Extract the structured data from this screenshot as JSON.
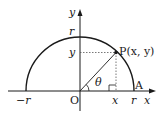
{
  "diagram": {
    "type": "unit-circle-semicircle",
    "colors": {
      "stroke": "#1a1a1a",
      "dashed": "#555555",
      "background": "#ffffff"
    },
    "axes": {
      "x_label": "x",
      "y_label": "y"
    },
    "labels": {
      "origin": "O",
      "point": "P(x, y)",
      "point_A": "A",
      "angle": "θ",
      "y_tick_r": "r",
      "y_tick_y": "y",
      "x_tick_neg_r": "−r",
      "x_tick_x": "x",
      "x_tick_r": "r"
    }
  }
}
